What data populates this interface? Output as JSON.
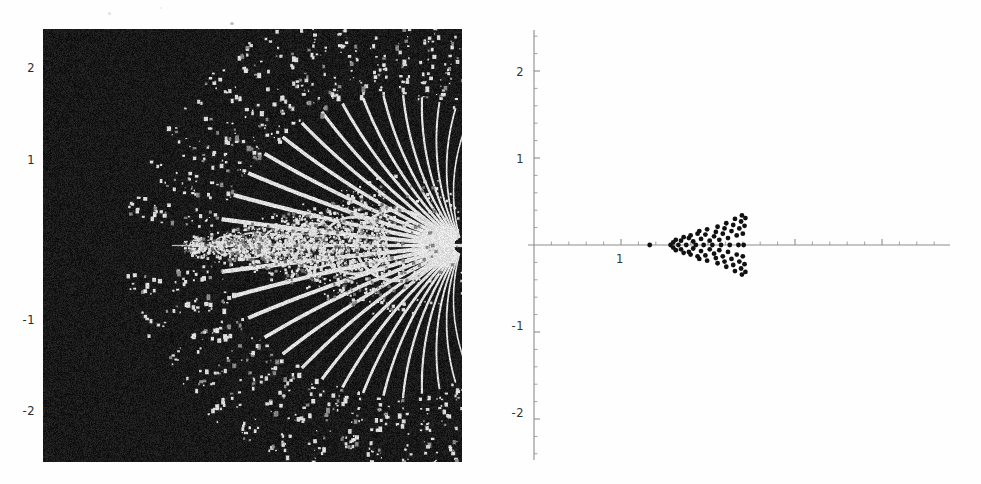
{
  "figure": {
    "title": "",
    "panels": [
      {
        "name": "left-fractal-panel",
        "render": "raster",
        "background": "#0a0a0a",
        "foreground": "#f2f2f2"
      },
      {
        "name": "right-scatter-panel",
        "render": "vector",
        "axis_color": "#808080",
        "point_color": "#111111"
      }
    ]
  },
  "left_panel": {
    "ytick_labels": [
      "2",
      "1",
      "-1",
      "-2"
    ],
    "ytick_y_px": [
      68,
      160,
      320,
      411
    ],
    "frame": {
      "x": 43,
      "y": 29,
      "w": 419,
      "h": 433
    }
  },
  "right_panel": {
    "ytick_labels": [
      "2",
      "1",
      "-1",
      "-2"
    ],
    "xtick_labels": [
      "1"
    ],
    "origin_px": {
      "x": 534,
      "y": 245
    },
    "unit_px": 87
  },
  "chart_data": {
    "type": "scatter",
    "title": "",
    "xlabel": "",
    "ylabel": "",
    "xlim": [
      -0.1,
      4.8
    ],
    "ylim": [
      -2.5,
      2.5
    ],
    "yticks": [
      -2,
      -1,
      1,
      2
    ],
    "xticks": [
      1
    ],
    "grid": false,
    "legend": null,
    "panels": [
      {
        "id": "left",
        "kind": "density-raster",
        "description": "Black-background escape-time style density plot: white filaments fan out radially toward the right edge from a central horizontal spine; self-similar bulb structure along the real axis.",
        "xlim": [
          -0.15,
          4.7
        ],
        "ylim": [
          -2.45,
          2.45
        ],
        "structure": {
          "spine_y": 0,
          "spine_x_range": [
            1.55,
            4.7
          ],
          "ray_count": 30,
          "ray_origin_x": 4.7,
          "ray_angle_span_deg": [
            -72,
            72
          ],
          "bulb_centers_x": [
            1.62,
            1.95,
            2.25,
            2.6,
            3.0,
            3.45,
            3.95
          ],
          "bulb_radii": [
            0.06,
            0.1,
            0.14,
            0.19,
            0.25,
            0.32,
            0.4
          ]
        }
      },
      {
        "id": "right",
        "kind": "scatter",
        "description": "Sparse black point cloud on white; isolated point near x=1.33, main self-similar cluster spanning x=1.55..2.43 with vertical spread widening to the right.",
        "xlim": [
          -0.1,
          4.8
        ],
        "ylim": [
          -2.5,
          2.5
        ],
        "points": [
          [
            1.33,
            0.0
          ],
          [
            1.57,
            0.0
          ],
          [
            1.6,
            0.03
          ],
          [
            1.6,
            -0.03
          ],
          [
            1.63,
            0.06
          ],
          [
            1.63,
            -0.06
          ],
          [
            1.66,
            0.0
          ],
          [
            1.69,
            0.05
          ],
          [
            1.69,
            -0.05
          ],
          [
            1.72,
            0.09
          ],
          [
            1.72,
            -0.09
          ],
          [
            1.75,
            0.0
          ],
          [
            1.78,
            0.08
          ],
          [
            1.78,
            -0.08
          ],
          [
            1.8,
            0.11
          ],
          [
            1.8,
            -0.11
          ],
          [
            1.83,
            0.04
          ],
          [
            1.83,
            -0.04
          ],
          [
            1.86,
            0.0
          ],
          [
            1.88,
            0.13
          ],
          [
            1.88,
            -0.13
          ],
          [
            1.9,
            0.16
          ],
          [
            1.9,
            -0.16
          ],
          [
            1.92,
            0.07
          ],
          [
            1.92,
            -0.07
          ],
          [
            1.95,
            0.0
          ],
          [
            1.97,
            0.12
          ],
          [
            1.97,
            -0.12
          ],
          [
            1.99,
            0.18
          ],
          [
            1.99,
            -0.18
          ],
          [
            2.02,
            0.05
          ],
          [
            2.02,
            -0.05
          ],
          [
            2.05,
            0.0
          ],
          [
            2.07,
            0.1
          ],
          [
            2.07,
            -0.1
          ],
          [
            2.09,
            0.15
          ],
          [
            2.09,
            -0.15
          ],
          [
            2.11,
            0.21
          ],
          [
            2.11,
            -0.21
          ],
          [
            2.13,
            0.06
          ],
          [
            2.13,
            -0.06
          ],
          [
            2.15,
            0.0
          ],
          [
            2.17,
            0.13
          ],
          [
            2.17,
            -0.13
          ],
          [
            2.19,
            0.19
          ],
          [
            2.19,
            -0.19
          ],
          [
            2.21,
            0.25
          ],
          [
            2.21,
            -0.25
          ],
          [
            2.23,
            0.08
          ],
          [
            2.23,
            -0.08
          ],
          [
            2.25,
            0.0
          ],
          [
            2.27,
            0.16
          ],
          [
            2.27,
            -0.16
          ],
          [
            2.29,
            0.23
          ],
          [
            2.29,
            -0.23
          ],
          [
            2.31,
            0.3
          ],
          [
            2.31,
            -0.3
          ],
          [
            2.33,
            0.11
          ],
          [
            2.33,
            -0.11
          ],
          [
            2.35,
            0.0
          ],
          [
            2.36,
            0.19
          ],
          [
            2.36,
            -0.19
          ],
          [
            2.38,
            0.27
          ],
          [
            2.38,
            -0.27
          ],
          [
            2.39,
            0.34
          ],
          [
            2.39,
            -0.34
          ],
          [
            2.4,
            0.13
          ],
          [
            2.4,
            -0.13
          ],
          [
            2.41,
            0.0
          ],
          [
            2.42,
            0.22
          ],
          [
            2.42,
            -0.22
          ],
          [
            2.43,
            0.31
          ],
          [
            2.43,
            -0.31
          ]
        ]
      }
    ]
  }
}
